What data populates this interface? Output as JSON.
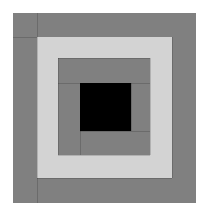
{
  "canvas": {
    "width": 207,
    "height": 215,
    "background": "#ffffff",
    "title": "Log Cabin Quilt Block"
  },
  "palette": {
    "dark": "#808080",
    "light": "#d3d3d3",
    "center": "#000000",
    "background": "#ffffff",
    "seam": "rgba(0,0,0,0.16)"
  },
  "chart_data": {
    "type": "heatmap",
    "xlabel": "",
    "ylabel": "",
    "legend": [
      {
        "name": "dark log",
        "color": "#808080"
      },
      {
        "name": "light log",
        "color": "#d3d3d3"
      },
      {
        "name": "center square",
        "color": "#000000"
      }
    ],
    "blocks": [
      {
        "name": "round-3-dark-top",
        "color": "#808080",
        "x": 13,
        "y": 13,
        "w": 183,
        "h": 24
      },
      {
        "name": "round-3-dark-left",
        "color": "#808080",
        "x": 13,
        "y": 37,
        "w": 24,
        "h": 166
      },
      {
        "name": "round-3-dark-bottom",
        "color": "#808080",
        "x": 37,
        "y": 178,
        "w": 159,
        "h": 25
      },
      {
        "name": "round-3-dark-right",
        "color": "#808080",
        "x": 172,
        "y": 37,
        "w": 24,
        "h": 141
      },
      {
        "name": "round-2-light-top",
        "color": "#d3d3d3",
        "x": 37,
        "y": 37,
        "w": 135,
        "h": 21
      },
      {
        "name": "round-2-light-left",
        "color": "#d3d3d3",
        "x": 37,
        "y": 58,
        "w": 21,
        "h": 120
      },
      {
        "name": "round-2-light-bottom",
        "color": "#d3d3d3",
        "x": 58,
        "y": 155,
        "w": 114,
        "h": 23
      },
      {
        "name": "round-2-light-right",
        "color": "#d3d3d3",
        "x": 150,
        "y": 58,
        "w": 22,
        "h": 97
      },
      {
        "name": "round-1-dark-top",
        "color": "#808080",
        "x": 58,
        "y": 58,
        "w": 92,
        "h": 25
      },
      {
        "name": "round-1-dark-left",
        "color": "#808080",
        "x": 58,
        "y": 83,
        "w": 22,
        "h": 72
      },
      {
        "name": "round-1-dark-bottom",
        "color": "#808080",
        "x": 80,
        "y": 131,
        "w": 70,
        "h": 24
      },
      {
        "name": "round-1-dark-right",
        "color": "#808080",
        "x": 131,
        "y": 83,
        "w": 19,
        "h": 48
      },
      {
        "name": "center-square",
        "color": "#000000",
        "x": 80,
        "y": 83,
        "w": 51,
        "h": 48
      }
    ],
    "seams": [
      {
        "name": "seam-outer-left-vertical",
        "x": 37,
        "y": 13,
        "w": 1,
        "h": 190
      },
      {
        "name": "seam-outer-top-horizontal",
        "x": 13,
        "y": 37,
        "w": 24,
        "h": 1
      },
      {
        "name": "seam-outer-right-vertical",
        "x": 172,
        "y": 37,
        "w": 1,
        "h": 141
      },
      {
        "name": "seam-outer-bottom-horiz",
        "x": 37,
        "y": 178,
        "w": 135,
        "h": 1
      },
      {
        "name": "seam-inner-left-vertical",
        "x": 58,
        "y": 58,
        "w": 1,
        "h": 97
      },
      {
        "name": "seam-inner-top-horizontal",
        "x": 58,
        "y": 58,
        "w": 92,
        "h": 1
      },
      {
        "name": "seam-inner-right-vertical",
        "x": 150,
        "y": 58,
        "w": 1,
        "h": 97
      },
      {
        "name": "seam-inner-bottom-horiz",
        "x": 58,
        "y": 155,
        "w": 92,
        "h": 1
      },
      {
        "name": "seam-core-top-horizontal",
        "x": 58,
        "y": 83,
        "w": 92,
        "h": 1
      },
      {
        "name": "seam-core-bottom-horiz",
        "x": 80,
        "y": 131,
        "w": 70,
        "h": 1
      },
      {
        "name": "seam-core-left-vertical",
        "x": 80,
        "y": 83,
        "w": 1,
        "h": 72
      },
      {
        "name": "seam-core-right-vertical",
        "x": 131,
        "y": 83,
        "w": 1,
        "h": 48
      }
    ]
  }
}
